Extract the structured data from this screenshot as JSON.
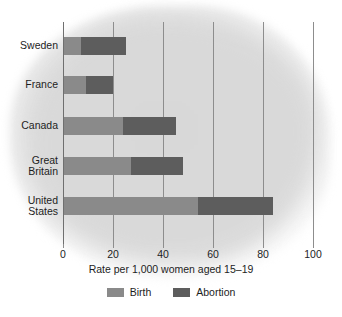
{
  "chart_data": {
    "type": "bar",
    "orientation": "horizontal",
    "stacked": true,
    "title": "",
    "xlabel": "Rate per 1,000 women aged 15–19",
    "ylabel": "",
    "xlim": [
      0,
      100
    ],
    "xticks": [
      "0",
      "20",
      "40",
      "60",
      "80",
      "100"
    ],
    "xtick_values": [
      0,
      20,
      40,
      60,
      80,
      100
    ],
    "grid": true,
    "legend_position": "bottom",
    "categories": [
      "Sweden",
      "France",
      "Canada",
      "Great Britain",
      "United States"
    ],
    "series": [
      {
        "name": "Birth",
        "color": "#8a8a8a",
        "values": [
          7,
          9,
          24,
          27,
          54
        ]
      },
      {
        "name": "Abortion",
        "color": "#5d5d5d",
        "values": [
          18,
          11,
          21,
          21,
          30
        ]
      }
    ],
    "totals": [
      25,
      20,
      45,
      48,
      84
    ]
  },
  "category_labels": [
    {
      "lines": [
        "Sweden"
      ]
    },
    {
      "lines": [
        "France"
      ]
    },
    {
      "lines": [
        "Canada"
      ]
    },
    {
      "lines": [
        "Great",
        "Britain"
      ]
    },
    {
      "lines": [
        "United",
        "States"
      ]
    }
  ],
  "legend": [
    {
      "label": "Birth",
      "color": "#8a8a8a"
    },
    {
      "label": "Abortion",
      "color": "#5d5d5d"
    }
  ],
  "axis": {
    "x_title": "Rate per 1,000 women aged 15–19"
  },
  "colors": {
    "birth": "#8a8a8a",
    "abortion": "#5d5d5d",
    "axis": "#6f6f6f",
    "grid": "#8d8d8d",
    "text": "#1d1d1d",
    "background_blob": "#d9d9d9",
    "page_background": "#ffffff"
  }
}
